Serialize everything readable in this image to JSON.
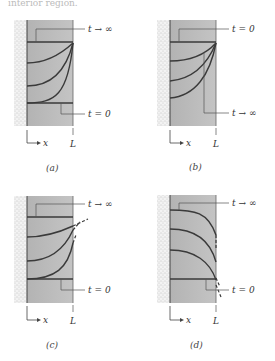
{
  "header_fragment": "interior region.",
  "colors": {
    "slab_fill": "#b9b9b9",
    "wall_stipple": "#8a8a8a",
    "curve": "#3a3a3a",
    "leader": "#555555",
    "text": "#333333"
  },
  "panels": [
    {
      "id": "a",
      "caption": "(a)",
      "top_label": "t → ∞",
      "bottom_label": "t = 0",
      "axis_label": "x",
      "length_label": "L"
    },
    {
      "id": "b",
      "caption": "(b)",
      "top_label": "t = 0",
      "bottom_label": "t → ∞",
      "axis_label": "x",
      "length_label": "L"
    },
    {
      "id": "c",
      "caption": "(c)",
      "top_label": "t → ∞",
      "bottom_label": "t = 0",
      "axis_label": "x",
      "length_label": "L"
    },
    {
      "id": "d",
      "caption": "(d)",
      "top_label": "t → ∞",
      "bottom_label": "t = 0",
      "axis_label": "x",
      "length_label": "L"
    }
  ]
}
